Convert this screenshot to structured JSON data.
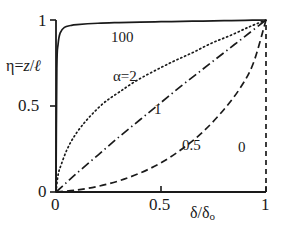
{
  "figure": {
    "background_color": "#ffffff",
    "line_color": "#1a1a1a"
  },
  "axes": {
    "x": {
      "title": "δ/δ",
      "title_sub": "o",
      "ticks": [
        "0",
        "0.5",
        "1"
      ],
      "tick_values": [
        0,
        0.5,
        1
      ],
      "range": [
        0,
        1
      ]
    },
    "y": {
      "title_eta": "η",
      "title_eq": "=",
      "title_z": "z",
      "title_slash": "/",
      "title_ell": "ℓ",
      "ticks": [
        "0",
        "0.5",
        "1"
      ],
      "tick_values": [
        0,
        0.5,
        1
      ],
      "range": [
        0,
        1
      ]
    }
  },
  "curve_labels": {
    "alpha_100": "100",
    "alpha_2": "α=2",
    "alpha_1": "1",
    "alpha_05": "0.5",
    "alpha_0": "0"
  },
  "chart_data": {
    "type": "line",
    "title": "",
    "xlabel": "δ/δo",
    "ylabel": "η=z/ℓ",
    "xlim": [
      0,
      1
    ],
    "ylim": [
      0,
      1
    ],
    "xticks": [
      0,
      0.5,
      1
    ],
    "yticks": [
      0,
      0.5,
      1
    ],
    "grid": false,
    "legend": "inline-curve-labels",
    "series": [
      {
        "name": "100",
        "alpha": 100,
        "linestyle": "solid",
        "label": "100",
        "x": [
          0,
          0.004,
          0.01,
          0.02,
          0.04,
          0.07,
          0.1,
          0.2,
          0.3,
          0.4,
          0.5,
          0.6,
          0.7,
          0.8,
          0.9,
          0.95,
          1
        ],
        "y": [
          0,
          0.72,
          0.86,
          0.925,
          0.957,
          0.968,
          0.973,
          0.981,
          0.985,
          0.988,
          0.99,
          0.992,
          0.994,
          0.996,
          0.998,
          0.999,
          1
        ]
      },
      {
        "name": "alpha=2",
        "alpha": 2,
        "linestyle": "dotted",
        "label": "α=2",
        "x": [
          0,
          0.01,
          0.025,
          0.05,
          0.08,
          0.12,
          0.17,
          0.23,
          0.3,
          0.38,
          0.47,
          0.56,
          0.65,
          0.74,
          0.83,
          0.92,
          1
        ],
        "y": [
          0,
          0.1,
          0.16,
          0.24,
          0.31,
          0.38,
          0.45,
          0.52,
          0.58,
          0.645,
          0.705,
          0.76,
          0.81,
          0.865,
          0.91,
          0.96,
          1
        ]
      },
      {
        "name": "1",
        "alpha": 1,
        "linestyle": "dashdot",
        "label": "1",
        "x": [
          0,
          0.05,
          0.1,
          0.2,
          0.3,
          0.4,
          0.5,
          0.6,
          0.7,
          0.8,
          0.9,
          1
        ],
        "y": [
          0,
          0.055,
          0.11,
          0.215,
          0.32,
          0.42,
          0.52,
          0.62,
          0.715,
          0.81,
          0.905,
          1
        ]
      },
      {
        "name": "0.5",
        "alpha": 0.5,
        "linestyle": "dashed",
        "label": "0.5",
        "x": [
          0,
          0.1,
          0.2,
          0.3,
          0.4,
          0.5,
          0.6,
          0.7,
          0.8,
          0.88,
          0.94,
          1
        ],
        "y": [
          0,
          0.012,
          0.033,
          0.065,
          0.11,
          0.17,
          0.25,
          0.35,
          0.48,
          0.61,
          0.75,
          1
        ]
      },
      {
        "name": "0",
        "alpha": 0,
        "linestyle": "dashed-vertical",
        "label": "0",
        "x": [
          1,
          1
        ],
        "y": [
          0,
          1
        ]
      }
    ]
  }
}
